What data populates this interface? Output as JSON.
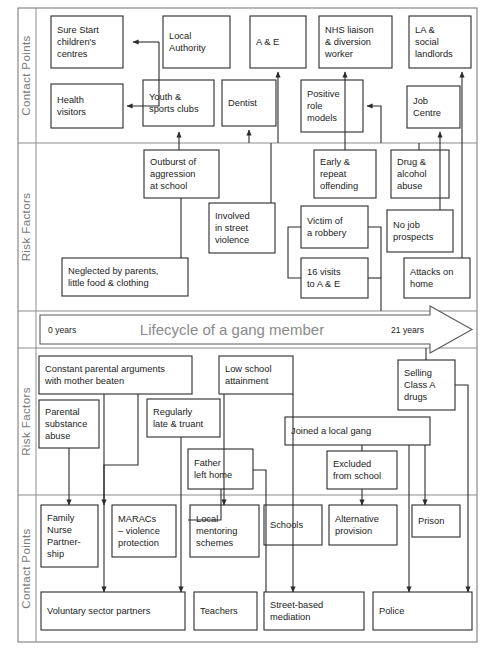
{
  "diagram": {
    "title": "Lifecycle of a gang member",
    "bands": [
      {
        "id": "contact-top",
        "label": "Contact Points"
      },
      {
        "id": "risk-top",
        "label": "Risk Factors"
      },
      {
        "id": "risk-bottom",
        "label": "Risk Factors"
      },
      {
        "id": "contact-bottom",
        "label": "Contact Points"
      }
    ],
    "lifecycle": {
      "title": "Lifecycle of a gang member",
      "start_label": "0 years",
      "end_label": "21 years"
    },
    "colors": {
      "box_stroke": "#2b2b2b",
      "band_stroke": "#8d8d8d",
      "title_text": "#8a8a8a",
      "band_label": "#7a7a7a",
      "background": "#ffffff"
    },
    "nodes": {
      "contact_top": [
        {
          "id": "sure-start",
          "lines": [
            "Sure Start",
            "children's",
            "centres"
          ],
          "x": 51,
          "y": 16,
          "w": 72,
          "h": 52
        },
        {
          "id": "health-visitors",
          "lines": [
            "Health",
            "visitors"
          ],
          "x": 51,
          "y": 84,
          "w": 72,
          "h": 44
        },
        {
          "id": "local-authority",
          "lines": [
            "Local",
            "Authority"
          ],
          "x": 163,
          "y": 16,
          "w": 67,
          "h": 52
        },
        {
          "id": "youth-sports-clubs",
          "lines": [
            "Youth &",
            "sports clubs"
          ],
          "x": 143,
          "y": 80,
          "w": 71,
          "h": 46
        },
        {
          "id": "dentist",
          "lines": [
            "Dentist"
          ],
          "x": 222,
          "y": 80,
          "w": 54,
          "h": 46
        },
        {
          "id": "a-and-e",
          "lines": [
            "A & E"
          ],
          "x": 250,
          "y": 16,
          "w": 56,
          "h": 52
        },
        {
          "id": "nhs-liaison",
          "lines": [
            "NHS liaison",
            "& diversion",
            "worker"
          ],
          "x": 319,
          "y": 16,
          "w": 73,
          "h": 52
        },
        {
          "id": "positive-role-models",
          "lines": [
            "Positive",
            "role",
            "models"
          ],
          "x": 301,
          "y": 80,
          "w": 62,
          "h": 52
        },
        {
          "id": "la-social-landlords",
          "lines": [
            "LA &",
            "social",
            "landlords"
          ],
          "x": 409,
          "y": 16,
          "w": 62,
          "h": 52
        },
        {
          "id": "job-centre",
          "lines": [
            "Job",
            "Centre"
          ],
          "x": 407,
          "y": 86,
          "w": 53,
          "h": 42
        }
      ],
      "risk_top": [
        {
          "id": "outburst-aggression",
          "lines": [
            "Outburst of",
            "aggression",
            "at school"
          ],
          "x": 144,
          "y": 150,
          "w": 75,
          "h": 48
        },
        {
          "id": "involved-street-violence",
          "lines": [
            "Involved",
            "in street",
            "violence"
          ],
          "x": 209,
          "y": 203,
          "w": 66,
          "h": 50
        },
        {
          "id": "neglected-by-parents",
          "lines": [
            "Neglected by parents,",
            "little food & clothing"
          ],
          "x": 62,
          "y": 258,
          "w": 126,
          "h": 38
        },
        {
          "id": "early-repeat-offending",
          "lines": [
            "Early &",
            "repeat",
            "offending"
          ],
          "x": 314,
          "y": 150,
          "w": 62,
          "h": 48
        },
        {
          "id": "drug-alcohol-abuse",
          "lines": [
            "Drug &",
            "alcohol",
            "abuse"
          ],
          "x": 391,
          "y": 150,
          "w": 58,
          "h": 48
        },
        {
          "id": "victim-of-a-robbery",
          "lines": [
            "Victim of",
            "a robbery"
          ],
          "x": 301,
          "y": 206,
          "w": 67,
          "h": 42
        },
        {
          "id": "no-job-prospects",
          "lines": [
            "No job",
            "prospects"
          ],
          "x": 387,
          "y": 210,
          "w": 66,
          "h": 42
        },
        {
          "id": "sixteen-visits-to-ae",
          "lines": [
            "16 visits",
            "to A & E"
          ],
          "x": 301,
          "y": 258,
          "w": 67,
          "h": 40
        },
        {
          "id": "attacks-on-home",
          "lines": [
            "Attacks on",
            "home"
          ],
          "x": 404,
          "y": 258,
          "w": 66,
          "h": 40
        }
      ],
      "risk_bottom": [
        {
          "id": "constant-parental-arguments",
          "lines": [
            "Constant parental arguments",
            "with mother beaten"
          ],
          "x": 39,
          "y": 356,
          "w": 153,
          "h": 38
        },
        {
          "id": "parental-substance-abuse",
          "lines": [
            "Parental",
            "substance",
            "abuse"
          ],
          "x": 39,
          "y": 400,
          "w": 60,
          "h": 48
        },
        {
          "id": "regularly-late-truant",
          "lines": [
            "Regularly",
            "late & truant"
          ],
          "x": 147,
          "y": 399,
          "w": 73,
          "h": 38
        },
        {
          "id": "father-left-home",
          "lines": [
            "Father",
            "left home"
          ],
          "x": 188,
          "y": 449,
          "w": 65,
          "h": 40
        },
        {
          "id": "low-school-attainment",
          "lines": [
            "Low school",
            "attainment"
          ],
          "x": 219,
          "y": 356,
          "w": 74,
          "h": 38
        },
        {
          "id": "selling-class-a-drugs",
          "lines": [
            "Selling",
            "Class A",
            "drugs"
          ],
          "x": 398,
          "y": 360,
          "w": 57,
          "h": 50
        },
        {
          "id": "joined-a-local-gang",
          "lines": [
            "Joined a local gang"
          ],
          "x": 285,
          "y": 417,
          "w": 145,
          "h": 28
        },
        {
          "id": "excluded-from-school",
          "lines": [
            "Excluded",
            "from school"
          ],
          "x": 327,
          "y": 451,
          "w": 70,
          "h": 38
        }
      ],
      "contact_bottom": [
        {
          "id": "family-nurse-partnership",
          "lines": [
            "Family",
            "Nurse",
            "Partner-",
            "ship"
          ],
          "x": 41,
          "y": 505,
          "w": 57,
          "h": 62
        },
        {
          "id": "maracs",
          "lines": [
            "MARACs",
            "– violence",
            "protection"
          ],
          "x": 112,
          "y": 505,
          "w": 64,
          "h": 52
        },
        {
          "id": "local-mentoring-schemes",
          "lines": [
            "Local",
            "mentoring",
            "schemes"
          ],
          "x": 190,
          "y": 505,
          "w": 69,
          "h": 52
        },
        {
          "id": "schools",
          "lines": [
            "Schools"
          ],
          "x": 264,
          "y": 505,
          "w": 58,
          "h": 40
        },
        {
          "id": "alternative-provision",
          "lines": [
            "Alternative",
            "provision"
          ],
          "x": 329,
          "y": 505,
          "w": 68,
          "h": 40
        },
        {
          "id": "prison",
          "lines": [
            "Prison"
          ],
          "x": 412,
          "y": 505,
          "w": 48,
          "h": 32
        },
        {
          "id": "voluntary-sector-partners",
          "lines": [
            "Voluntary sector partners"
          ],
          "x": 41,
          "y": 592,
          "w": 144,
          "h": 38
        },
        {
          "id": "teachers",
          "lines": [
            "Teachers"
          ],
          "x": 194,
          "y": 592,
          "w": 63,
          "h": 38
        },
        {
          "id": "street-based-mediation",
          "lines": [
            "Street-based",
            "mediation"
          ],
          "x": 264,
          "y": 592,
          "w": 100,
          "h": 38
        },
        {
          "id": "police",
          "lines": [
            "Police"
          ],
          "x": 373,
          "y": 592,
          "w": 99,
          "h": 38
        }
      ]
    }
  }
}
